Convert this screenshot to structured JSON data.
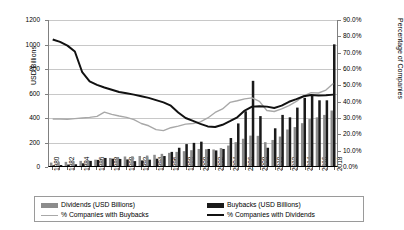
{
  "chart_data": {
    "type": "bar",
    "title": "",
    "xlabel": "",
    "ylabel": "USD Billions",
    "ylabel_secondary": "Percentage of Companies",
    "ylim": [
      0,
      1200
    ],
    "ytick_step": 200,
    "ylim_secondary": [
      0,
      0.9
    ],
    "ytick_step_secondary": 0.1,
    "grid": true,
    "legend_position": "bottom",
    "yticks": [
      "0",
      "200",
      "400",
      "600",
      "800",
      "1000",
      "1200"
    ],
    "yticks_secondary": [
      "0.0%",
      "10.0%",
      "20.0%",
      "30.0%",
      "40.0%",
      "50.0%",
      "60.0%",
      "70.0%",
      "80.0%",
      "90.0%"
    ],
    "categories": [
      "1980",
      "1981",
      "1982",
      "1983",
      "1984",
      "1985",
      "1986",
      "1987",
      "1988",
      "1989",
      "1990",
      "1991",
      "1992",
      "1993",
      "1994",
      "1995",
      "1996",
      "1997",
      "1998",
      "1999",
      "2000",
      "2001",
      "2002",
      "2003",
      "2004",
      "2005",
      "2006",
      "2007",
      "2008",
      "2009",
      "2010",
      "2011",
      "2012",
      "2013",
      "2014",
      "2015",
      "2016",
      "2017",
      "2018"
    ],
    "xtick_labels": [
      "1980",
      "1982",
      "1984",
      "1986",
      "1988",
      "1990",
      "1992",
      "1994",
      "1996",
      "1998",
      "2000",
      "2002",
      "2004",
      "2006",
      "2008",
      "2010",
      "2012",
      "2014",
      "2016",
      "2018"
    ],
    "series": [
      {
        "name": "Dividends (USD Billions)",
        "type": "bar",
        "axis": "left",
        "color": "#8c8c8c",
        "values": [
          28,
          32,
          34,
          38,
          42,
          48,
          52,
          58,
          66,
          72,
          78,
          80,
          82,
          86,
          92,
          100,
          108,
          116,
          122,
          130,
          140,
          138,
          136,
          148,
          168,
          196,
          224,
          250,
          248,
          196,
          214,
          242,
          300,
          320,
          352,
          386,
          400,
          420,
          456
        ]
      },
      {
        "name": "Buybacks (USD Billions)",
        "type": "bar",
        "axis": "left",
        "color": "#1a1a1a",
        "values": [
          6,
          8,
          12,
          14,
          22,
          42,
          50,
          66,
          60,
          58,
          54,
          40,
          46,
          52,
          60,
          82,
          116,
          150,
          180,
          190,
          200,
          140,
          128,
          140,
          230,
          350,
          450,
          700,
          410,
          150,
          310,
          420,
          400,
          480,
          560,
          580,
          540,
          540,
          1000
        ]
      },
      {
        "name": "% Companies with Buybacks",
        "type": "line",
        "axis": "right",
        "color": "#a8a8a8",
        "values": [
          0.29,
          0.29,
          0.288,
          0.292,
          0.296,
          0.3,
          0.306,
          0.332,
          0.318,
          0.308,
          0.3,
          0.286,
          0.262,
          0.248,
          0.224,
          0.218,
          0.236,
          0.246,
          0.258,
          0.262,
          0.272,
          0.296,
          0.33,
          0.352,
          0.392,
          0.402,
          0.414,
          0.42,
          0.398,
          0.342,
          0.336,
          0.352,
          0.372,
          0.398,
          0.432,
          0.452,
          0.45,
          0.468,
          0.508
        ]
      },
      {
        "name": "% Companies with Dividends",
        "type": "line",
        "axis": "right",
        "color": "#111111",
        "values": [
          0.78,
          0.765,
          0.742,
          0.706,
          0.578,
          0.522,
          0.5,
          0.484,
          0.47,
          0.456,
          0.448,
          0.44,
          0.43,
          0.42,
          0.406,
          0.392,
          0.372,
          0.33,
          0.296,
          0.278,
          0.26,
          0.244,
          0.24,
          0.254,
          0.276,
          0.3,
          0.342,
          0.366,
          0.368,
          0.366,
          0.358,
          0.372,
          0.396,
          0.412,
          0.43,
          0.438,
          0.434,
          0.436,
          0.44
        ]
      }
    ]
  },
  "axes": {
    "left_title": "USD Billions",
    "right_title": "Percentage of Companies"
  },
  "legend": {
    "items": [
      {
        "label": "Dividends (USD Billions)",
        "marker": "bar",
        "color": "#8c8c8c"
      },
      {
        "label": "Buybacks (USD Billions)",
        "marker": "bar",
        "color": "#1a1a1a"
      },
      {
        "label": "% Companies with Buybacks",
        "marker": "line",
        "color": "#a8a8a8"
      },
      {
        "label": "% Companies with Dividends",
        "marker": "line",
        "color": "#111111"
      }
    ]
  }
}
